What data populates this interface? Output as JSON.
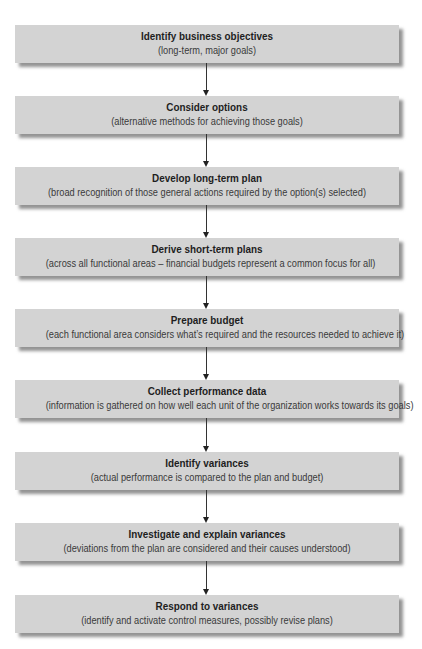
{
  "diagram": {
    "type": "vertical-flowchart",
    "box_color": "#d3d3d3",
    "title_color": "#1e1e1e",
    "subtitle_color": "#3a3a3a",
    "arrow_color": "#333333",
    "steps": [
      {
        "title": "Identify business objectives",
        "subtitle": "(long-term, major goals)"
      },
      {
        "title": "Consider options",
        "subtitle": "(alternative methods for achieving those goals)"
      },
      {
        "title": "Develop long-term plan",
        "subtitle": "(broad recognition of those general actions required by the option(s) selected)"
      },
      {
        "title": "Derive short-term plans",
        "subtitle": "(across all functional areas – financial budgets represent a common focus for all)"
      },
      {
        "title": "Prepare budget",
        "subtitle": "(each functional area considers what’s required and the resources needed to achieve it)"
      },
      {
        "title": "Collect performance data",
        "subtitle": "(information is gathered on how well each unit of the organization works towards its goals)"
      },
      {
        "title": "Identify variances",
        "subtitle": "(actual performance is compared to the plan and budget)"
      },
      {
        "title": "Investigate and explain variances",
        "subtitle": "(deviations from the plan are considered and their causes understood)"
      },
      {
        "title": "Respond to variances",
        "subtitle": "(identify and activate control measures, possibly revise plans)"
      }
    ],
    "connections": [
      {
        "from": 0,
        "to": 1
      },
      {
        "from": 1,
        "to": 2
      },
      {
        "from": 2,
        "to": 3
      },
      {
        "from": 3,
        "to": 4
      },
      {
        "from": 4,
        "to": 5
      },
      {
        "from": 5,
        "to": 6
      },
      {
        "from": 6,
        "to": 7
      },
      {
        "from": 7,
        "to": 8
      }
    ]
  }
}
